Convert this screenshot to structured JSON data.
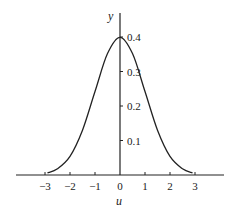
{
  "chart_data": {
    "type": "line",
    "title": "",
    "xlabel": "u",
    "ylabel": "y",
    "xlim": [
      -4.2,
      4.2
    ],
    "ylim": [
      0,
      0.44
    ],
    "grid": false,
    "legend": null,
    "x_ticks": [
      -3,
      -2,
      -1,
      0,
      1,
      2,
      3
    ],
    "x_tick_labels": [
      "−3",
      "−2",
      "−1",
      "0",
      "1",
      "2",
      "3"
    ],
    "y_ticks": [
      0.1,
      0.2,
      0.3,
      0.4
    ],
    "y_tick_labels": [
      "0.1",
      "0.2",
      "0.3",
      "0.4"
    ],
    "series": [
      {
        "name": "standard normal density",
        "x": [
          -2.9,
          -2.5,
          -2.0,
          -1.5,
          -1.0,
          -0.5,
          0.0,
          0.5,
          1.0,
          1.5,
          2.0,
          2.5,
          2.9
        ],
        "values": [
          0.006,
          0.018,
          0.054,
          0.13,
          0.242,
          0.352,
          0.399,
          0.352,
          0.242,
          0.13,
          0.054,
          0.018,
          0.006
        ]
      }
    ],
    "color": "#222222"
  }
}
